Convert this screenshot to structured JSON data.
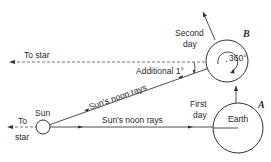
{
  "diagram": {
    "labels": {
      "to_star_top": "To star",
      "to_star_left_1": "To",
      "to_star_left_2": "star",
      "sun": "Sun",
      "earth": "Earth",
      "point_a": "A",
      "point_b": "B",
      "second_day_1": "Second",
      "second_day_2": "day",
      "first_day_1": "First",
      "first_day_2": "day",
      "additional": "Additional 1°",
      "rotation": "360°",
      "noon_rays_slanted": "Sun's noon rays",
      "noon_rays_horizontal": "Sun's noon rays"
    },
    "colors": {
      "line": "#3a3a3a",
      "text": "#2a2a2a",
      "background": "#ffffff"
    }
  }
}
